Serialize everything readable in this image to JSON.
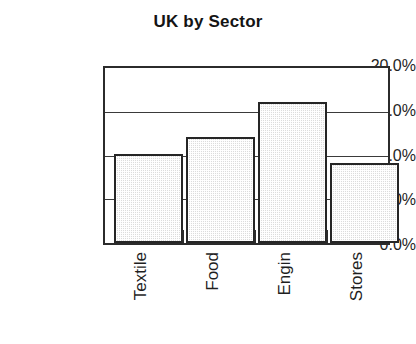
{
  "chart_data": {
    "type": "bar",
    "title": "UK by Sector",
    "xlabel": "",
    "ylabel": "",
    "categories": [
      "Textile",
      "Food",
      "Engin",
      "Stores"
    ],
    "values": [
      10.2,
      12.1,
      16.1,
      9.2
    ],
    "value_labels": [
      "10.2%",
      "12.1%",
      "16.1%",
      "9.2%"
    ],
    "ylim": [
      0.0,
      20.0
    ],
    "ytick_values": [
      20.0,
      15.0,
      10.0,
      5.0,
      0.0
    ],
    "ytick_labels": [
      "20.0%",
      "15.0%",
      "10.0%",
      "5.0%",
      "0.0%"
    ],
    "grid": true,
    "grid_axis": "y",
    "legend": false,
    "legend_position": "none",
    "series": [
      {
        "name": "UK by Sector",
        "values": [
          10.2,
          12.1,
          16.1,
          9.2
        ]
      }
    ],
    "bar_fill_color": "#dcdcdc",
    "bar_edge_color": "#262626",
    "axis_color": "#2b2b2b",
    "text_color": "#1f1f1f",
    "background_color": "#ffffff",
    "xtick_marks": 3,
    "category_label_rotation": "-90"
  }
}
